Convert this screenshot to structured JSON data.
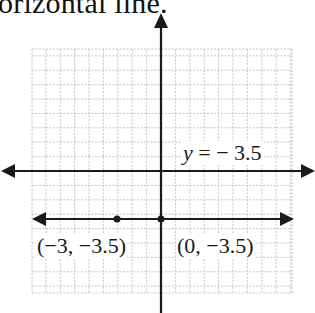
{
  "caption": {
    "text": "orizontal line."
  },
  "colors": {
    "axis": "#1a1a1a",
    "grid": "#b9b9b9",
    "line": "#1a1a1a",
    "background": "#ffffff"
  },
  "equation": {
    "var": "y",
    "rest": " = − 3.5"
  },
  "points": [
    {
      "label": "(−3, −3.5)",
      "x": -3,
      "y": -3.5
    },
    {
      "label": "(0, −3.5)",
      "x": 0,
      "y": -3.5
    }
  ],
  "chart_data": {
    "type": "line",
    "title": "",
    "xlabel": "",
    "ylabel": "",
    "grid": true,
    "legend": "none",
    "xlim": [
      -9,
      9
    ],
    "ylim": [
      -8.5,
      8.5
    ],
    "series": [
      {
        "name": "y = −3.5",
        "x": [
          -9,
          -3,
          0,
          9
        ],
        "y": [
          -3.5,
          -3.5,
          -3.5,
          -3.5
        ]
      }
    ],
    "annotations": [
      {
        "text": "y = −3.5",
        "x": 4,
        "y": -0.5
      },
      {
        "text": "(−3, −3.5)",
        "x": -3,
        "y": -3.5
      },
      {
        "text": "(0, −3.5)",
        "x": 0,
        "y": -3.5
      }
    ],
    "marked_points": [
      {
        "x": -3,
        "y": -3.5
      },
      {
        "x": 0,
        "y": -3.5
      }
    ]
  }
}
